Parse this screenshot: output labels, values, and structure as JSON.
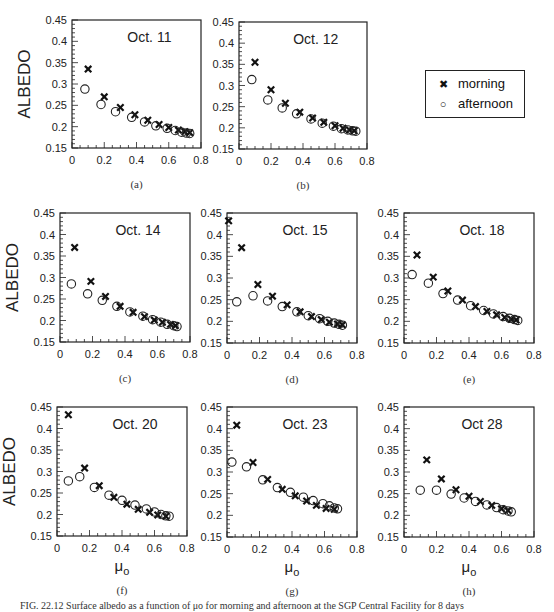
{
  "figure": {
    "caption_partial": "FIG. 22.12 Surface albedo as a function of μo for morning and afternoon at the SGP Central Facility for 8 days",
    "legend": {
      "items": [
        {
          "label": "morning",
          "marker": "x"
        },
        {
          "label": "afternoon",
          "marker": "o"
        }
      ]
    }
  },
  "chart_data": [
    {
      "panel": "(a)",
      "type": "scatter",
      "title": "Oct. 11",
      "xlabel": "",
      "ylabel": "ALBEDO",
      "xlim": [
        0,
        0.8
      ],
      "ylim": [
        0.15,
        0.45
      ],
      "xticks": [
        "0",
        "0.2",
        "0.4",
        "0.6",
        "0.8"
      ],
      "yticks": [
        "0.15",
        "0.2",
        "0.25",
        "0.3",
        "0.35",
        "0.4",
        "0.45"
      ],
      "series": [
        {
          "name": "morning",
          "marker": "x",
          "points": [
            [
              0.1,
              0.335
            ],
            [
              0.2,
              0.27
            ],
            [
              0.3,
              0.245
            ],
            [
              0.39,
              0.228
            ],
            [
              0.47,
              0.215
            ],
            [
              0.54,
              0.205
            ],
            [
              0.6,
              0.198
            ],
            [
              0.66,
              0.192
            ],
            [
              0.7,
              0.188
            ],
            [
              0.73,
              0.186
            ]
          ]
        },
        {
          "name": "afternoon",
          "marker": "o",
          "points": [
            [
              0.08,
              0.288
            ],
            [
              0.18,
              0.252
            ],
            [
              0.27,
              0.235
            ],
            [
              0.37,
              0.222
            ],
            [
              0.45,
              0.211
            ],
            [
              0.52,
              0.202
            ],
            [
              0.59,
              0.196
            ],
            [
              0.64,
              0.191
            ],
            [
              0.68,
              0.187
            ],
            [
              0.71,
              0.185
            ],
            [
              0.73,
              0.184
            ]
          ]
        }
      ]
    },
    {
      "panel": "(b)",
      "type": "scatter",
      "title": "Oct. 12",
      "xlabel": "",
      "ylabel": "",
      "xlim": [
        0,
        0.8
      ],
      "ylim": [
        0.15,
        0.45
      ],
      "xticks": [
        "0",
        "0.2",
        "0.4",
        "0.6",
        "0.8"
      ],
      "yticks": [
        "0.15",
        "0.2",
        "0.25",
        "0.3",
        "0.35",
        "0.4",
        "0.45"
      ],
      "series": [
        {
          "name": "morning",
          "marker": "x",
          "points": [
            [
              0.1,
              0.355
            ],
            [
              0.2,
              0.29
            ],
            [
              0.29,
              0.258
            ],
            [
              0.38,
              0.237
            ],
            [
              0.46,
              0.223
            ],
            [
              0.53,
              0.213
            ],
            [
              0.6,
              0.205
            ],
            [
              0.65,
              0.199
            ],
            [
              0.69,
              0.195
            ],
            [
              0.72,
              0.193
            ]
          ]
        },
        {
          "name": "afternoon",
          "marker": "o",
          "points": [
            [
              0.08,
              0.314
            ],
            [
              0.18,
              0.266
            ],
            [
              0.27,
              0.247
            ],
            [
              0.36,
              0.233
            ],
            [
              0.45,
              0.221
            ],
            [
              0.52,
              0.211
            ],
            [
              0.59,
              0.204
            ],
            [
              0.64,
              0.198
            ],
            [
              0.68,
              0.195
            ],
            [
              0.71,
              0.193
            ],
            [
              0.73,
              0.192
            ]
          ]
        }
      ]
    },
    {
      "panel": "(c)",
      "type": "scatter",
      "title": "Oct. 14",
      "xlabel": "",
      "ylabel": "ALBEDO",
      "xlim": [
        0,
        0.8
      ],
      "ylim": [
        0.15,
        0.45
      ],
      "xticks": [
        "0",
        "0.2",
        "0.4",
        "0.6",
        "0.8"
      ],
      "yticks": [
        "0.15",
        "0.2",
        "0.25",
        "0.3",
        "0.35",
        "0.4",
        "0.45"
      ],
      "series": [
        {
          "name": "morning",
          "marker": "x",
          "points": [
            [
              0.09,
              0.37
            ],
            [
              0.19,
              0.291
            ],
            [
              0.28,
              0.256
            ],
            [
              0.37,
              0.233
            ],
            [
              0.45,
              0.219
            ],
            [
              0.52,
              0.209
            ],
            [
              0.58,
              0.201
            ],
            [
              0.63,
              0.196
            ],
            [
              0.68,
              0.191
            ],
            [
              0.71,
              0.188
            ]
          ]
        },
        {
          "name": "afternoon",
          "marker": "o",
          "points": [
            [
              0.07,
              0.285
            ],
            [
              0.17,
              0.262
            ],
            [
              0.26,
              0.247
            ],
            [
              0.35,
              0.233
            ],
            [
              0.43,
              0.22
            ],
            [
              0.51,
              0.21
            ],
            [
              0.57,
              0.202
            ],
            [
              0.62,
              0.196
            ],
            [
              0.66,
              0.191
            ],
            [
              0.7,
              0.188
            ],
            [
              0.72,
              0.186
            ]
          ]
        }
      ]
    },
    {
      "panel": "(d)",
      "type": "scatter",
      "title": "Oct. 15",
      "xlabel": "",
      "ylabel": "",
      "xlim": [
        0,
        0.8
      ],
      "ylim": [
        0.15,
        0.45
      ],
      "xticks": [
        "0",
        "0.2",
        "0.4",
        "0.6",
        "0.8"
      ],
      "yticks": [
        "0.15",
        "0.2",
        "0.25",
        "0.3",
        "0.35",
        "0.4",
        "0.45"
      ],
      "series": [
        {
          "name": "morning",
          "marker": "x",
          "points": [
            [
              0.01,
              0.432
            ],
            [
              0.09,
              0.37
            ],
            [
              0.19,
              0.285
            ],
            [
              0.28,
              0.258
            ],
            [
              0.37,
              0.238
            ],
            [
              0.45,
              0.222
            ],
            [
              0.52,
              0.211
            ],
            [
              0.58,
              0.204
            ],
            [
              0.63,
              0.198
            ],
            [
              0.68,
              0.194
            ],
            [
              0.71,
              0.192
            ]
          ]
        },
        {
          "name": "afternoon",
          "marker": "o",
          "points": [
            [
              0.06,
              0.245
            ],
            [
              0.16,
              0.259
            ],
            [
              0.25,
              0.247
            ],
            [
              0.34,
              0.234
            ],
            [
              0.43,
              0.222
            ],
            [
              0.5,
              0.213
            ],
            [
              0.57,
              0.206
            ],
            [
              0.62,
              0.2
            ],
            [
              0.66,
              0.196
            ],
            [
              0.69,
              0.193
            ],
            [
              0.71,
              0.191
            ]
          ]
        }
      ]
    },
    {
      "panel": "(e)",
      "type": "scatter",
      "title": "Oct. 18",
      "xlabel": "",
      "ylabel": "",
      "xlim": [
        0,
        0.8
      ],
      "ylim": [
        0.15,
        0.45
      ],
      "xticks": [
        "0",
        "0.2",
        "0.4",
        "0.6",
        "0.8"
      ],
      "yticks": [
        "0.15",
        "0.2",
        "0.25",
        "0.3",
        "0.35",
        "0.4",
        "0.45"
      ],
      "series": [
        {
          "name": "morning",
          "marker": "x",
          "points": [
            [
              0.08,
              0.353
            ],
            [
              0.18,
              0.302
            ],
            [
              0.27,
              0.27
            ],
            [
              0.36,
              0.249
            ],
            [
              0.44,
              0.234
            ],
            [
              0.51,
              0.223
            ],
            [
              0.57,
              0.215
            ],
            [
              0.62,
              0.209
            ],
            [
              0.66,
              0.205
            ],
            [
              0.69,
              0.203
            ]
          ]
        },
        {
          "name": "afternoon",
          "marker": "o",
          "points": [
            [
              0.05,
              0.308
            ],
            [
              0.15,
              0.288
            ],
            [
              0.24,
              0.264
            ],
            [
              0.33,
              0.249
            ],
            [
              0.41,
              0.236
            ],
            [
              0.49,
              0.225
            ],
            [
              0.55,
              0.217
            ],
            [
              0.61,
              0.211
            ],
            [
              0.65,
              0.207
            ],
            [
              0.68,
              0.204
            ],
            [
              0.7,
              0.202
            ]
          ]
        }
      ]
    },
    {
      "panel": "(f)",
      "type": "scatter",
      "title": "Oct. 20",
      "xlabel": "μo",
      "ylabel": "ALBEDO",
      "xlim": [
        0,
        0.8
      ],
      "ylim": [
        0.15,
        0.45
      ],
      "xticks": [
        "0",
        "0.2",
        "0.4",
        "0.6",
        "0.8"
      ],
      "yticks": [
        "0.15",
        "0.2",
        "0.25",
        "0.3",
        "0.35",
        "0.4",
        "0.45"
      ],
      "series": [
        {
          "name": "morning",
          "marker": "x",
          "points": [
            [
              0.07,
              0.432
            ],
            [
              0.17,
              0.308
            ],
            [
              0.26,
              0.267
            ],
            [
              0.35,
              0.24
            ],
            [
              0.43,
              0.224
            ],
            [
              0.5,
              0.212
            ],
            [
              0.57,
              0.205
            ],
            [
              0.62,
              0.199
            ],
            [
              0.67,
              0.196
            ]
          ]
        },
        {
          "name": "afternoon",
          "marker": "o",
          "points": [
            [
              0.07,
              0.278
            ],
            [
              0.14,
              0.288
            ],
            [
              0.23,
              0.263
            ],
            [
              0.32,
              0.245
            ],
            [
              0.4,
              0.233
            ],
            [
              0.48,
              0.222
            ],
            [
              0.55,
              0.213
            ],
            [
              0.6,
              0.206
            ],
            [
              0.64,
              0.2
            ],
            [
              0.67,
              0.197
            ],
            [
              0.69,
              0.196
            ]
          ]
        }
      ]
    },
    {
      "panel": "(g)",
      "type": "scatter",
      "title": "Oct. 23",
      "xlabel": "μo",
      "ylabel": "",
      "xlim": [
        0,
        0.8
      ],
      "ylim": [
        0.15,
        0.45
      ],
      "xticks": [
        "0",
        "0.2",
        "0.4",
        "0.6",
        "0.8"
      ],
      "yticks": [
        "0.15",
        "0.2",
        "0.25",
        "0.3",
        "0.35",
        "0.4",
        "0.45"
      ],
      "series": [
        {
          "name": "morning",
          "marker": "x",
          "points": [
            [
              0.06,
              0.408
            ],
            [
              0.16,
              0.322
            ],
            [
              0.25,
              0.283
            ],
            [
              0.34,
              0.26
            ],
            [
              0.42,
              0.245
            ],
            [
              0.49,
              0.233
            ],
            [
              0.55,
              0.223
            ],
            [
              0.61,
              0.216
            ],
            [
              0.66,
              0.214
            ]
          ]
        },
        {
          "name": "afternoon",
          "marker": "o",
          "points": [
            [
              0.03,
              0.323
            ],
            [
              0.12,
              0.312
            ],
            [
              0.22,
              0.282
            ],
            [
              0.31,
              0.264
            ],
            [
              0.39,
              0.253
            ],
            [
              0.47,
              0.242
            ],
            [
              0.53,
              0.234
            ],
            [
              0.59,
              0.227
            ],
            [
              0.63,
              0.222
            ],
            [
              0.66,
              0.217
            ],
            [
              0.68,
              0.215
            ]
          ]
        }
      ]
    },
    {
      "panel": "(h)",
      "type": "scatter",
      "title": "Oct 28",
      "xlabel": "μo",
      "ylabel": "",
      "xlim": [
        0,
        0.8
      ],
      "ylim": [
        0.15,
        0.45
      ],
      "xticks": [
        "0",
        "0.2",
        "0.4",
        "0.6",
        "0.8"
      ],
      "yticks": [
        "0.15",
        "0.2",
        "0.25",
        "0.3",
        "0.35",
        "0.4",
        "0.45"
      ],
      "series": [
        {
          "name": "morning",
          "marker": "x",
          "points": [
            [
              0.14,
              0.328
            ],
            [
              0.23,
              0.284
            ],
            [
              0.32,
              0.259
            ],
            [
              0.4,
              0.244
            ],
            [
              0.47,
              0.232
            ],
            [
              0.54,
              0.223
            ],
            [
              0.6,
              0.215
            ],
            [
              0.64,
              0.211
            ]
          ]
        },
        {
          "name": "afternoon",
          "marker": "o",
          "points": [
            [
              0.1,
              0.258
            ],
            [
              0.2,
              0.258
            ],
            [
              0.29,
              0.249
            ],
            [
              0.37,
              0.24
            ],
            [
              0.44,
              0.232
            ],
            [
              0.51,
              0.224
            ],
            [
              0.57,
              0.218
            ],
            [
              0.61,
              0.213
            ],
            [
              0.64,
              0.21
            ],
            [
              0.66,
              0.208
            ]
          ]
        }
      ]
    }
  ]
}
